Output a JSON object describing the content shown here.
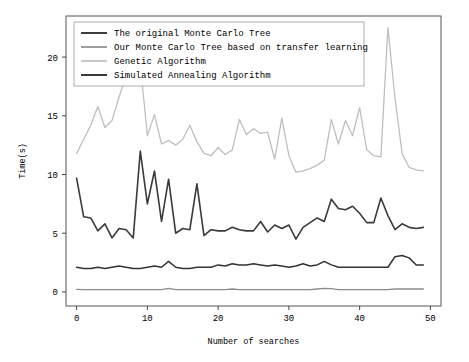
{
  "chart_data": {
    "type": "line",
    "title": "",
    "xlabel": "Number of searches",
    "ylabel": "Time(s)",
    "xlim": [
      -1.5,
      51.5
    ],
    "ylim": [
      -1.2,
      23.5
    ],
    "xticks": [
      0,
      10,
      20,
      30,
      40,
      50
    ],
    "yticks": [
      0,
      5,
      10,
      15,
      20
    ],
    "grid": false,
    "legend_position": "upper left",
    "x": [
      0,
      1,
      2,
      3,
      4,
      5,
      6,
      7,
      8,
      9,
      10,
      11,
      12,
      13,
      14,
      15,
      16,
      17,
      18,
      19,
      20,
      21,
      22,
      23,
      24,
      25,
      26,
      27,
      28,
      29,
      30,
      31,
      32,
      33,
      34,
      35,
      36,
      37,
      38,
      39,
      40,
      41,
      42,
      43,
      44,
      45,
      46,
      47,
      48,
      49
    ],
    "series": [
      {
        "name": "The original Monte Carlo Tree",
        "color": "#333333",
        "width": 1.5,
        "values": [
          2.1,
          2.0,
          2.0,
          2.1,
          2.0,
          2.1,
          2.2,
          2.1,
          2.0,
          2.0,
          2.1,
          2.2,
          2.1,
          2.6,
          2.1,
          2.0,
          2.0,
          2.1,
          2.1,
          2.1,
          2.3,
          2.2,
          2.4,
          2.3,
          2.3,
          2.4,
          2.3,
          2.2,
          2.3,
          2.2,
          2.1,
          2.2,
          2.4,
          2.2,
          2.3,
          2.6,
          2.3,
          2.1,
          2.1,
          2.1,
          2.1,
          2.1,
          2.1,
          2.1,
          2.1,
          3.0,
          3.1,
          2.9,
          2.3,
          2.3
        ]
      },
      {
        "name": "Our Monte Carlo Tree based on transfer learning",
        "color": "#8c8c8c",
        "width": 1.3,
        "values": [
          0.22,
          0.2,
          0.2,
          0.2,
          0.2,
          0.2,
          0.2,
          0.2,
          0.2,
          0.2,
          0.2,
          0.2,
          0.2,
          0.3,
          0.2,
          0.2,
          0.2,
          0.2,
          0.2,
          0.2,
          0.2,
          0.2,
          0.25,
          0.2,
          0.2,
          0.2,
          0.2,
          0.2,
          0.2,
          0.2,
          0.2,
          0.2,
          0.2,
          0.2,
          0.25,
          0.3,
          0.28,
          0.2,
          0.2,
          0.2,
          0.2,
          0.2,
          0.2,
          0.2,
          0.2,
          0.25,
          0.25,
          0.25,
          0.25,
          0.25
        ]
      },
      {
        "name": "Genetic Algorithm",
        "color": "#bfbfbf",
        "width": 1.3,
        "values": [
          11.8,
          13.0,
          14.2,
          15.8,
          14.0,
          14.6,
          16.6,
          18.4,
          22.0,
          19.4,
          13.3,
          15.1,
          12.6,
          12.9,
          12.5,
          13.0,
          14.2,
          12.8,
          11.8,
          11.6,
          12.3,
          11.7,
          12.1,
          14.7,
          13.4,
          13.9,
          13.5,
          13.6,
          11.3,
          14.8,
          11.6,
          10.2,
          10.3,
          10.5,
          10.8,
          11.2,
          14.7,
          12.6,
          14.6,
          13.3,
          15.7,
          12.1,
          11.6,
          11.5,
          22.5,
          16.5,
          11.8,
          10.6,
          10.4,
          10.3
        ]
      },
      {
        "name": "Simulated Annealing Algorithm",
        "color": "#3a3a3a",
        "width": 1.6,
        "values": [
          9.7,
          6.4,
          6.3,
          5.2,
          5.8,
          4.6,
          5.4,
          5.3,
          4.6,
          12.0,
          7.5,
          10.3,
          6.0,
          9.6,
          5.0,
          5.4,
          5.3,
          9.2,
          4.8,
          5.3,
          5.2,
          5.2,
          5.5,
          5.3,
          5.2,
          5.2,
          6.0,
          5.1,
          5.7,
          5.4,
          5.7,
          4.5,
          5.5,
          5.9,
          6.3,
          6.0,
          7.9,
          7.1,
          7.0,
          7.3,
          6.7,
          5.9,
          5.9,
          8.0,
          6.5,
          5.3,
          5.8,
          5.5,
          5.4,
          5.5
        ]
      }
    ]
  },
  "legend": {
    "entries": [
      {
        "label": "The original Monte Carlo Tree"
      },
      {
        "label": "Our Monte Carlo Tree based on transfer learning"
      },
      {
        "label": "Genetic Algorithm"
      },
      {
        "label": "Simulated Annealing Algorithm"
      }
    ]
  },
  "axes": {
    "ylabel": "Time(s)",
    "xlabel": "Number of searches",
    "xtick_labels": [
      "0",
      "10",
      "20",
      "30",
      "40",
      "50"
    ],
    "ytick_labels": [
      "0",
      "5",
      "10",
      "15",
      "20"
    ]
  }
}
